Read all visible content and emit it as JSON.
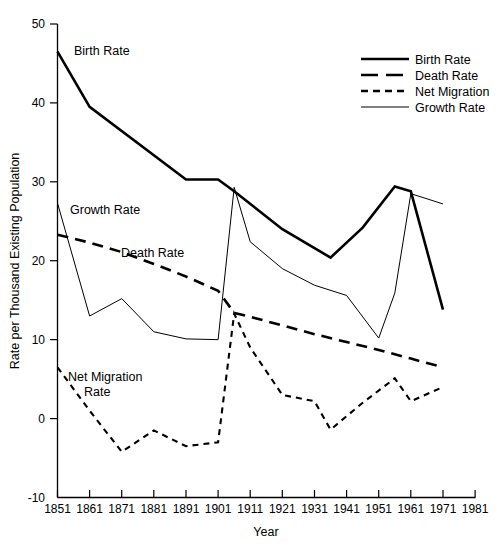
{
  "chart_data": {
    "type": "line",
    "title": "",
    "xlabel": "Year",
    "ylabel": "Rate per Thousand Existing Population",
    "xlim": [
      1851,
      1981
    ],
    "ylim": [
      -10,
      50
    ],
    "xticks": [
      1851,
      1861,
      1871,
      1881,
      1891,
      1901,
      1911,
      1921,
      1931,
      1941,
      1951,
      1961,
      1971,
      1981
    ],
    "yticks": [
      -10,
      0,
      10,
      20,
      30,
      40,
      50
    ],
    "grid": false,
    "legend_position": "top-right",
    "series": [
      {
        "name": "Birth Rate",
        "style": "solid-thick",
        "x": [
          1851,
          1861,
          1891,
          1901,
          1906,
          1921,
          1936,
          1946,
          1956,
          1961,
          1971
        ],
        "values": [
          46.5,
          39.5,
          30.3,
          30.3,
          28.8,
          24.0,
          20.4,
          24.2,
          29.4,
          28.8,
          13.8
        ]
      },
      {
        "name": "Death Rate",
        "style": "dashed-thick",
        "x": [
          1851,
          1861,
          1871,
          1881,
          1891,
          1901,
          1906,
          1911,
          1921,
          1931,
          1941,
          1951,
          1961,
          1971
        ],
        "values": [
          23.3,
          22.3,
          21.1,
          19.6,
          18.0,
          16.2,
          13.4,
          12.9,
          11.8,
          10.7,
          9.7,
          8.7,
          7.6,
          6.5
        ]
      },
      {
        "name": "Net Migration",
        "style": "dashed-thin",
        "x": [
          1851,
          1861,
          1871,
          1881,
          1891,
          1901,
          1906,
          1911,
          1921,
          1931,
          1936,
          1946,
          1956,
          1961,
          1971
        ],
        "values": [
          6.5,
          1.0,
          -4.2,
          -1.5,
          -3.5,
          -3.0,
          13.3,
          9.0,
          3.0,
          2.2,
          -1.4,
          2.0,
          5.1,
          2.2,
          4.0
        ]
      },
      {
        "name": "Growth Rate",
        "style": "solid-thin",
        "x": [
          1851,
          1861,
          1871,
          1881,
          1891,
          1901,
          1906,
          1911,
          1921,
          1931,
          1941,
          1951,
          1956,
          1961,
          1971
        ],
        "values": [
          27.3,
          13.0,
          15.2,
          11.0,
          10.1,
          10.0,
          29.3,
          22.4,
          19.0,
          16.9,
          15.6,
          10.2,
          15.9,
          28.5,
          27.2
        ]
      }
    ],
    "inline_annotations": [
      {
        "id": "birth-rate-annotation",
        "text": "Birth Rate"
      },
      {
        "id": "growth-rate-annotation",
        "text": "Growth Rate"
      },
      {
        "id": "death-rate-annotation",
        "text": "Death Rate"
      },
      {
        "id": "net-migration-annotation-line1",
        "text": "Net Migration"
      },
      {
        "id": "net-migration-annotation-line2",
        "text": "Rate"
      }
    ],
    "legend_entries": [
      {
        "label": "Birth Rate",
        "style": "solid-thick"
      },
      {
        "label": "Death Rate",
        "style": "dashed-thick"
      },
      {
        "label": "Net Migration",
        "style": "dashed-thin"
      },
      {
        "label": "Growth Rate",
        "style": "solid-thin"
      }
    ],
    "colors": {
      "ink": "#000000",
      "background": "#ffffff"
    }
  }
}
